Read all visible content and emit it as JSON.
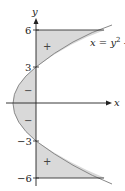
{
  "diagram": {
    "axes": {
      "x_label": "x",
      "y_label": "y"
    },
    "y_ticks": [
      {
        "value": 6,
        "label": "6"
      },
      {
        "value": 3,
        "label": "3"
      },
      {
        "value": -3,
        "label": "−3"
      },
      {
        "value": -6,
        "label": "−6"
      }
    ],
    "curve_label": "x = y² -",
    "curve_label_parts": {
      "lhs": "x",
      "eq": " = ",
      "base": "y",
      "sup": "2",
      "tail": " -"
    },
    "region_signs": {
      "top": "+",
      "upper_middle": "−",
      "lower_middle": "−",
      "bottom": "+"
    },
    "colors": {
      "fill": "#d9d9d9",
      "curve": "#888888",
      "axis": "#222222"
    }
  }
}
